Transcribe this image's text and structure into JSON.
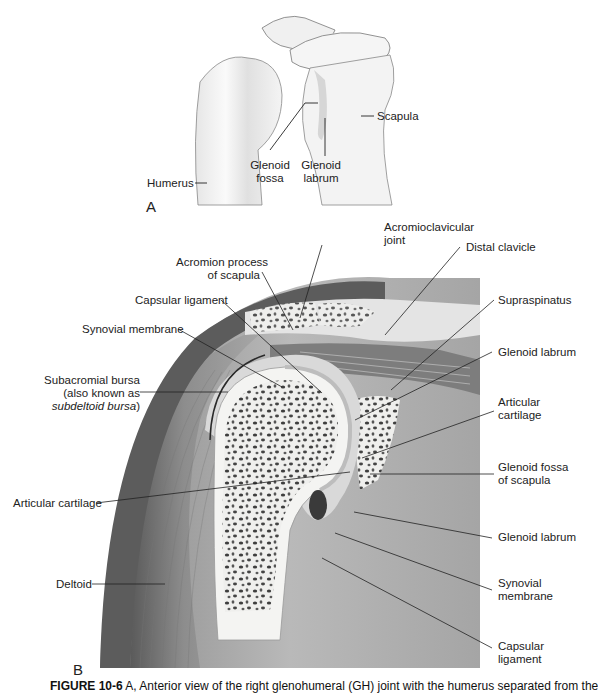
{
  "figure": {
    "panel_a": {
      "letter": "A",
      "labels": {
        "scapula": "Scapula",
        "humerus": "Humerus",
        "glenoid_fossa": [
          "Glenoid",
          "fossa"
        ],
        "glenoid_labrum": [
          "Glenoid",
          "labrum"
        ]
      }
    },
    "panel_b": {
      "letter": "B",
      "labels": {
        "acromioclavicular_joint": [
          "Acromioclavicular",
          "joint"
        ],
        "distal_clavicle": "Distal clavicle",
        "acromion_process": [
          "Acromion process",
          "of scapula"
        ],
        "capsular_ligament_top": "Capsular ligament",
        "synovial_membrane_top": "Synovial membrane",
        "subacromial_bursa": [
          "Subacromial bursa",
          "(also known as",
          "subdeltoid bursa",
          ")"
        ],
        "supraspinatus": "Supraspinatus",
        "glenoid_labrum_top": "Glenoid labrum",
        "articular_cartilage_right": [
          "Articular",
          "cartilage"
        ],
        "glenoid_fossa_scapula": [
          "Glenoid fossa",
          "of scapula"
        ],
        "articular_cartilage_left": "Articular cartilage",
        "glenoid_labrum_bottom": "Glenoid labrum",
        "synovial_membrane_bottom": [
          "Synovial",
          "membrane"
        ],
        "deltoid": "Deltoid",
        "capsular_ligament_bottom": [
          "Capsular",
          "ligament"
        ]
      }
    },
    "caption": {
      "number": "FIGURE 10-6",
      "text": " A, Anterior view of the right glenohumeral (GH) joint with the humerus separated from the"
    }
  },
  "colors": {
    "bone": "#f2f2f0",
    "muscle_dark": "#6a6a6a",
    "muscle_mid": "#9a9a9a",
    "soft_tissue": "#b8b8b8",
    "cartilage": "#dcdcdc",
    "line": "#2a2a2a"
  }
}
